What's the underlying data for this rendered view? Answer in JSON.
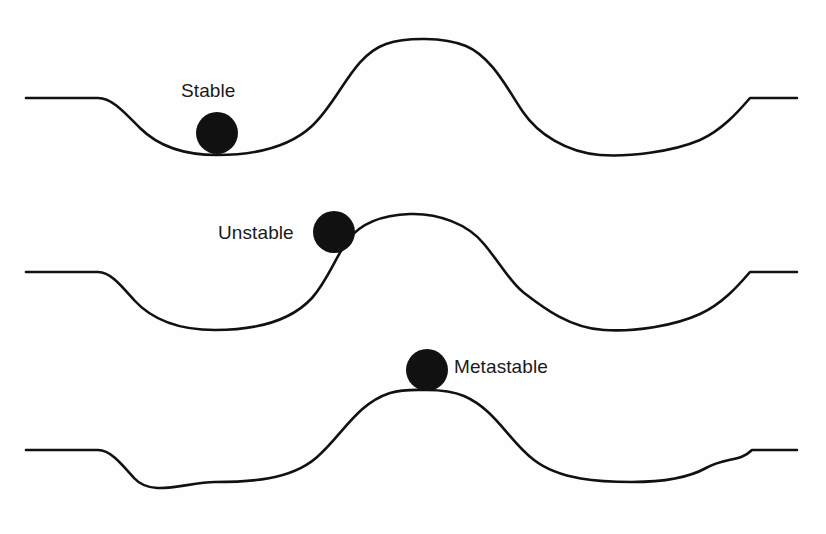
{
  "figure": {
    "background_color": "#fefefe",
    "stroke_color": "#111111",
    "ball_color": "#111111",
    "text_color": "#1a1a1a",
    "width": 826,
    "height": 534
  },
  "labels": {
    "stable": "Stable",
    "unstable": "Unstable",
    "metastable": "Metastable"
  },
  "chart_data": {
    "type": "line",
    "title": "",
    "xlabel": "",
    "ylabel": "",
    "grid": false,
    "legend": "none",
    "annotations": [
      "Stable",
      "Unstable",
      "Metastable"
    ],
    "panels": [
      {
        "name": "stable",
        "label": "Stable",
        "label_position": {
          "x": 181,
          "y": 80
        },
        "flat_left_y": 98,
        "flat_left_x": [
          26,
          100
        ],
        "flat_right_y": 98,
        "flat_right_x": [
          750,
          797
        ],
        "valley_left": {
          "x": 215,
          "y": 155
        },
        "peak": {
          "x": 425,
          "y": 40
        },
        "valley_right": {
          "x": 645,
          "y": 155
        },
        "inflection": {
          "x": 523,
          "y": 112
        },
        "ball": {
          "cx": 217,
          "cy": 133,
          "r": 21
        },
        "ball_resting_on": "left-valley-bottom"
      },
      {
        "name": "unstable",
        "label": "Unstable",
        "label_position": {
          "x": 218,
          "y": 222
        },
        "flat_left_y": 272,
        "flat_left_x": [
          26,
          100
        ],
        "flat_right_y": 272,
        "flat_right_x": [
          750,
          797
        ],
        "valley_left": {
          "x": 215,
          "y": 330
        },
        "peak": {
          "x": 425,
          "y": 214
        },
        "valley_right": {
          "x": 645,
          "y": 330
        },
        "inflection": {
          "x": 523,
          "y": 286
        },
        "ball": {
          "cx": 334,
          "cy": 232,
          "r": 21
        },
        "ball_resting_on": "rising-slope"
      },
      {
        "name": "metastable",
        "label": "Metastable",
        "label_position": {
          "x": 454,
          "y": 356
        },
        "flat_left_y": 450,
        "flat_left_x": [
          26,
          100
        ],
        "flat_right_y": 450,
        "flat_right_x": [
          750,
          797
        ],
        "valley_left": {
          "x": 215,
          "y": 482
        },
        "peak": {
          "x": 427,
          "y": 390
        },
        "valley_right": {
          "x": 645,
          "y": 482
        },
        "ball": {
          "cx": 427,
          "cy": 370,
          "r": 21
        },
        "ball_resting_on": "peak-apex"
      }
    ]
  }
}
